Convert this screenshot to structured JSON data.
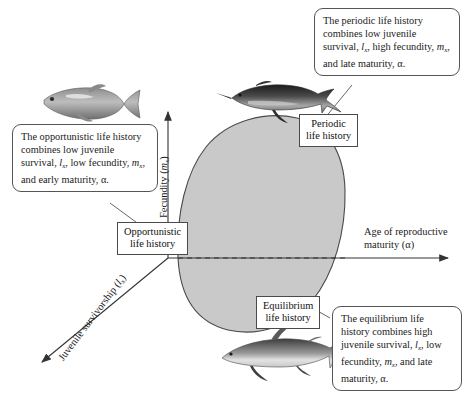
{
  "diagram": {
    "blob_color": "#c9c9c9",
    "blob_stroke": "#4a4a4a",
    "line_color": "#555555"
  },
  "axes": {
    "x": {
      "name": "age-of-reproductive-maturity-axis",
      "label_line1": "Age of reproductive",
      "label_line2": "maturity (α)"
    },
    "y": {
      "name": "fecundity-axis",
      "label_prefix": "Fecundity (",
      "label_var": "m",
      "label_sub": "x",
      "label_suffix": ")"
    },
    "z": {
      "name": "juvenile-survivorship-axis",
      "label_prefix": "Juvenile survivorship (",
      "label_var": "l",
      "label_sub": "x",
      "label_suffix": ")"
    }
  },
  "labels": {
    "opportunistic": {
      "line1": "Opportunistic",
      "line2": "life history"
    },
    "periodic": {
      "line1": "Periodic",
      "line2": "life history"
    },
    "equilibrium": {
      "line1": "Equilibrium",
      "line2": "life history"
    }
  },
  "callouts": {
    "periodic": {
      "seg1": "The periodic life history combines low juvenile survival, ",
      "var1": "l",
      "sub1": "x",
      "seg2": ", high fecundity, ",
      "var2": "m",
      "sub2": "x",
      "seg3": ", and late maturity, α."
    },
    "opportunistic": {
      "seg1": "The opportunistic life history combines low juvenile survival, ",
      "var1": "l",
      "sub1": "x",
      "seg2": ", low fecundity, ",
      "var2": "m",
      "sub2": "x",
      "seg3": ", and early maturity, α."
    },
    "equilibrium": {
      "seg1": "The equilibrium life history combines high juvenile survival, ",
      "var1": "l",
      "sub1": "x",
      "seg2": ", low fecundity, ",
      "var2": "m",
      "sub2": "x",
      "seg3": ", and late maturity, α."
    }
  },
  "illustrations": {
    "opportunistic_fish": "killifish-photo",
    "periodic_fish": "sturgeon-photo",
    "equilibrium_fish": "shark-photo"
  }
}
